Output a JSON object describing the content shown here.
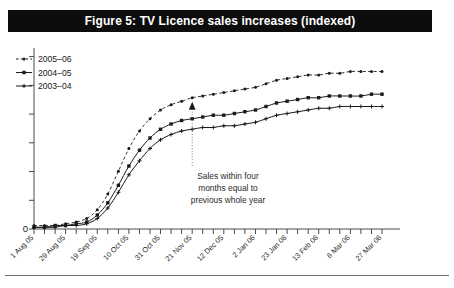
{
  "figure": {
    "title": "Figure 5: TV Licence sales increases (indexed)",
    "title_bar_color": "#0d0d0d",
    "title_text_color": "#ffffff",
    "background": "#ffffff"
  },
  "annotation": {
    "line1": "Sales within four",
    "line2": "months equal to",
    "line3": "previous whole year",
    "pointer": "up-arrow",
    "anchor_category": "21 Nov 05"
  },
  "axes": {
    "y_zero_label": "0",
    "y_tick_count": 7,
    "x_label_rotation": -45
  },
  "chart_data": {
    "type": "line",
    "title": "Figure 5: TV Licence sales increases (indexed)",
    "xlabel": "",
    "ylabel": "",
    "grid": false,
    "legend_position": "top-left",
    "ylim": [
      0,
      100
    ],
    "y_ticklabels": [
      "0",
      "",
      "",
      "",
      "",
      "",
      ""
    ],
    "x": [
      "1 Aug 05",
      "8 Aug 05",
      "15 Aug 05",
      "29 Aug 05",
      "5 Sep 05",
      "12 Sep 05",
      "19 Sep 05",
      "26 Sep 05",
      "3 Oct 05",
      "10 Oct 05",
      "17 Oct 05",
      "24 Oct 05",
      "31 Oct 05",
      "7 Nov 05",
      "14 Nov 05",
      "21 Nov 05",
      "28 Nov 05",
      "5 Dec 05",
      "12 Dec 05",
      "19 Dec 05",
      "26 Dec 05",
      "2 Jan 06",
      "9 Jan 06",
      "16 Jan 06",
      "23 Jan 06",
      "30 Jan 06",
      "6 Feb 06",
      "13 Feb 06",
      "20 Feb 06",
      "27 Feb 06",
      "6 Mar 06",
      "13 Mar 06",
      "20 Mar 06",
      "27 Mar 06"
    ],
    "x_ticklabels": [
      "1 Aug 05",
      "29 Aug 05",
      "19 Sep 05",
      "10 Oct 05",
      "31 Oct 05",
      "21 Nov 05",
      "12 Dec 05",
      "2 Jan 06",
      "23 Jan 06",
      "13 Feb 06",
      "6 Mar 06",
      "27 Mar 06"
    ],
    "x_ticklabel_every": 3,
    "series": [
      {
        "name": "2005–06",
        "style": "dashed",
        "marker": "dot",
        "color": "#1a1a1a",
        "values": [
          2,
          2,
          2,
          3,
          4,
          6,
          11,
          20,
          33,
          46,
          56,
          63,
          68,
          71,
          73,
          75,
          76,
          77,
          78,
          79,
          80,
          81,
          83,
          85,
          86,
          87,
          88,
          88,
          89,
          89,
          90,
          90,
          90,
          90
        ]
      },
      {
        "name": "2004–05",
        "style": "solid",
        "marker": "square",
        "color": "#1a1a1a",
        "values": [
          1,
          1,
          2,
          2,
          3,
          4,
          8,
          15,
          25,
          36,
          45,
          52,
          57,
          60,
          62,
          63,
          64,
          65,
          65,
          66,
          67,
          68,
          70,
          72,
          73,
          74,
          75,
          75,
          76,
          76,
          76,
          76,
          77,
          77
        ]
      },
      {
        "name": "2003–04",
        "style": "solid",
        "marker": "plus",
        "color": "#1a1a1a",
        "values": [
          1,
          1,
          1,
          2,
          2,
          3,
          6,
          12,
          21,
          31,
          39,
          46,
          51,
          54,
          56,
          57,
          58,
          58,
          59,
          59,
          60,
          61,
          63,
          65,
          66,
          67,
          68,
          69,
          69,
          70,
          70,
          70,
          70,
          70
        ]
      }
    ]
  }
}
